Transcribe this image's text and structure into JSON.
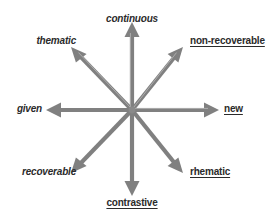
{
  "figure": {
    "kind": "eight-axis-star-diagram",
    "background_color": "#ffffff",
    "arrow_color": "#808080",
    "arrow_highlight_color": "#b0b0b0",
    "text_color": "#2b2b2b",
    "center": {
      "x": 132,
      "y": 110
    }
  },
  "labels": {
    "north": {
      "text": "continuous",
      "style": "italic",
      "x": 132,
      "y": 14,
      "anchor": "center"
    },
    "northeast": {
      "text": "non-recoverable",
      "style": "underline",
      "x": 190,
      "y": 36,
      "anchor": "left"
    },
    "east": {
      "text": "new",
      "style": "underline",
      "x": 224,
      "y": 104,
      "anchor": "left"
    },
    "southeast": {
      "text": "rhematic",
      "style": "underline",
      "x": 190,
      "y": 167,
      "anchor": "left"
    },
    "south": {
      "text": "contrastive",
      "style": "underline",
      "x": 132,
      "y": 198,
      "anchor": "center"
    },
    "southwest": {
      "text": "recoverable",
      "style": "italic",
      "x": 76,
      "y": 167,
      "anchor": "right"
    },
    "west": {
      "text": "given",
      "style": "italic",
      "x": 42,
      "y": 104,
      "anchor": "right"
    },
    "northwest": {
      "text": "thematic",
      "style": "italic",
      "x": 76,
      "y": 36,
      "anchor": "right"
    }
  },
  "arrows": {
    "north": {
      "tip_x": 132,
      "tip_y": 22
    },
    "northeast": {
      "tip_x": 183,
      "tip_y": 47
    },
    "east": {
      "tip_x": 219,
      "tip_y": 110
    },
    "southeast": {
      "tip_x": 183,
      "tip_y": 173
    },
    "south": {
      "tip_x": 132,
      "tip_y": 196
    },
    "southwest": {
      "tip_x": 71,
      "tip_y": 173
    },
    "west": {
      "tip_x": 46,
      "tip_y": 110
    },
    "northwest": {
      "tip_x": 71,
      "tip_y": 47
    }
  }
}
